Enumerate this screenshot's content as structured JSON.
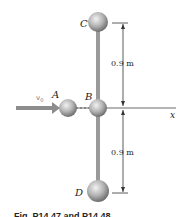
{
  "figure": {
    "labels": {
      "A": "A",
      "B": "B",
      "C": "C",
      "D": "D",
      "v0": "v",
      "v0_sub": "0",
      "x_axis": "x"
    },
    "dimensions": {
      "upper": "0.9 m",
      "lower": "0.9 m"
    },
    "caption": "Fig. P14.47 and P14.48",
    "colors": {
      "sphere_light": "#e6e6e6",
      "sphere_dark": "#7d7d7d",
      "rod": "#9a9a9a",
      "arrow": "#8c8c8c",
      "line": "#333333"
    }
  }
}
